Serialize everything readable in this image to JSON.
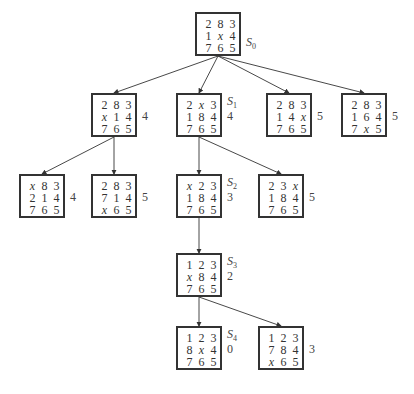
{
  "diagram": {
    "type": "8-puzzle heuristic search tree",
    "nodes": [
      {
        "id": "S0",
        "state_name": "S",
        "state_sub": "0",
        "h": "",
        "cells": [
          "2",
          "8",
          "3",
          "1",
          "x",
          "4",
          "7",
          "6",
          "5"
        ],
        "x": 195,
        "y": 12
      },
      {
        "id": "L1a",
        "state_name": "",
        "state_sub": "",
        "h": "4",
        "cells": [
          "2",
          "8",
          "3",
          "x",
          "1",
          "4",
          "7",
          "6",
          "5"
        ],
        "x": 91,
        "y": 93
      },
      {
        "id": "S1",
        "state_name": "S",
        "state_sub": "1",
        "h": "4",
        "cells": [
          "2",
          "x",
          "3",
          "1",
          "8",
          "4",
          "7",
          "6",
          "5"
        ],
        "x": 176,
        "y": 93
      },
      {
        "id": "L1c",
        "state_name": "",
        "state_sub": "",
        "h": "5",
        "cells": [
          "2",
          "8",
          "3",
          "1",
          "4",
          "x",
          "7",
          "6",
          "5"
        ],
        "x": 266,
        "y": 93
      },
      {
        "id": "L1d",
        "state_name": "",
        "state_sub": "",
        "h": "5",
        "cells": [
          "2",
          "8",
          "3",
          "1",
          "6",
          "4",
          "7",
          "x",
          "5"
        ],
        "x": 341,
        "y": 93
      },
      {
        "id": "L2a",
        "state_name": "",
        "state_sub": "",
        "h": "4",
        "cells": [
          "x",
          "8",
          "3",
          "2",
          "1",
          "4",
          "7",
          "6",
          "5"
        ],
        "x": 19,
        "y": 174
      },
      {
        "id": "L2b",
        "state_name": "",
        "state_sub": "",
        "h": "5",
        "cells": [
          "2",
          "8",
          "3",
          "7",
          "1",
          "4",
          "x",
          "6",
          "5"
        ],
        "x": 91,
        "y": 174
      },
      {
        "id": "S2",
        "state_name": "S",
        "state_sub": "2",
        "h": "3",
        "cells": [
          "x",
          "2",
          "3",
          "1",
          "8",
          "4",
          "7",
          "6",
          "5"
        ],
        "x": 176,
        "y": 174
      },
      {
        "id": "L2d",
        "state_name": "",
        "state_sub": "",
        "h": "5",
        "cells": [
          "2",
          "3",
          "x",
          "1",
          "8",
          "4",
          "7",
          "6",
          "5"
        ],
        "x": 258,
        "y": 174
      },
      {
        "id": "S3",
        "state_name": "S",
        "state_sub": "3",
        "h": "2",
        "cells": [
          "1",
          "2",
          "3",
          "x",
          "8",
          "4",
          "7",
          "6",
          "5"
        ],
        "x": 176,
        "y": 253
      },
      {
        "id": "S4",
        "state_name": "S",
        "state_sub": "4",
        "h": "0",
        "cells": [
          "1",
          "2",
          "3",
          "8",
          "x",
          "4",
          "7",
          "6",
          "5"
        ],
        "x": 176,
        "y": 326
      },
      {
        "id": "L4b",
        "state_name": "",
        "state_sub": "",
        "h": "3",
        "cells": [
          "1",
          "2",
          "3",
          "7",
          "8",
          "4",
          "x",
          "6",
          "5"
        ],
        "x": 258,
        "y": 326
      }
    ],
    "edges": [
      [
        "S0",
        "L1a"
      ],
      [
        "S0",
        "S1"
      ],
      [
        "S0",
        "L1c"
      ],
      [
        "S0",
        "L1d"
      ],
      [
        "L1a",
        "L2a"
      ],
      [
        "L1a",
        "L2b"
      ],
      [
        "S1",
        "S2"
      ],
      [
        "S1",
        "L2d"
      ],
      [
        "S2",
        "S3"
      ],
      [
        "S3",
        "S4"
      ],
      [
        "S3",
        "L4b"
      ]
    ]
  }
}
